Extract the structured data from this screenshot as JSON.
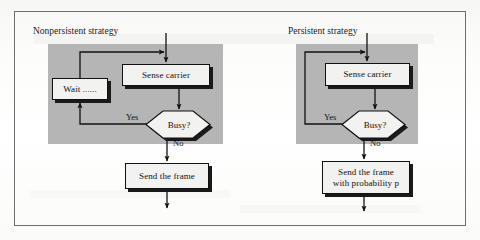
{
  "figure": {
    "type": "flowchart",
    "panels": [
      {
        "id": "nonpersistent",
        "title": "Nonpersistent strategy",
        "nodes": [
          {
            "id": "wait",
            "shape": "process",
            "label": "Wait ......"
          },
          {
            "id": "sense",
            "shape": "process",
            "label": "Sense carrier"
          },
          {
            "id": "busy",
            "shape": "decision",
            "label": "Busy?"
          },
          {
            "id": "send",
            "shape": "process",
            "label": "Send the frame"
          }
        ],
        "edges": [
          {
            "from": "start",
            "to": "sense",
            "label": ""
          },
          {
            "from": "sense",
            "to": "busy",
            "label": ""
          },
          {
            "from": "busy",
            "to": "wait",
            "label": "Yes"
          },
          {
            "from": "wait",
            "to": "sense",
            "label": ""
          },
          {
            "from": "busy",
            "to": "send",
            "label": "No"
          },
          {
            "from": "send",
            "to": "end",
            "label": ""
          }
        ]
      },
      {
        "id": "persistent",
        "title": "Persistent strategy",
        "nodes": [
          {
            "id": "sense",
            "shape": "process",
            "label": "Sense carrier"
          },
          {
            "id": "busy",
            "shape": "decision",
            "label": "Busy?"
          },
          {
            "id": "send",
            "shape": "process",
            "label_line1": "Send the frame",
            "label_line2": "with probability p"
          }
        ],
        "edges": [
          {
            "from": "start",
            "to": "sense",
            "label": ""
          },
          {
            "from": "sense",
            "to": "busy",
            "label": ""
          },
          {
            "from": "busy",
            "to": "sense",
            "label": "Yes"
          },
          {
            "from": "busy",
            "to": "send",
            "label": "No"
          },
          {
            "from": "send",
            "to": "end",
            "label": ""
          }
        ]
      }
    ],
    "colors": {
      "panel_fill": "#b5b5b5",
      "node_fill": "#f2f2f0",
      "stroke": "#111111",
      "frame_border": "#6e6e6e",
      "page_background": "#fdfdfd"
    }
  }
}
